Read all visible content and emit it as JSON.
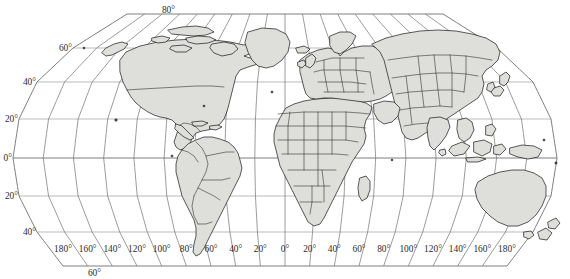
{
  "map": {
    "title": "World map (Robinson-style projection)",
    "projection": "robinson",
    "land_fill_color": "#dededb",
    "coast_stroke_color": "#1a1a1a",
    "graticule_color": "#8d8d8d",
    "background_color": "#ffffff",
    "degree_symbol": "°",
    "partial_top_text": "",
    "latitude_labels": [
      {
        "text": "80°",
        "value": 80,
        "hemisphere": "N"
      },
      {
        "text": "60°",
        "value": 60,
        "hemisphere": "N"
      },
      {
        "text": "40°",
        "value": 40,
        "hemisphere": "N"
      },
      {
        "text": "20°",
        "value": 20,
        "hemisphere": "N"
      },
      {
        "text": "0°",
        "value": 0,
        "hemisphere": ""
      },
      {
        "text": "20°",
        "value": -20,
        "hemisphere": "S"
      },
      {
        "text": "40°",
        "value": -40,
        "hemisphere": "S"
      },
      {
        "text": "60°",
        "value": -60,
        "hemisphere": "S"
      }
    ],
    "longitude_labels": [
      {
        "text": "180°",
        "value": -180
      },
      {
        "text": "160°",
        "value": -160
      },
      {
        "text": "140°",
        "value": -140
      },
      {
        "text": "120°",
        "value": -120
      },
      {
        "text": "100°",
        "value": -100
      },
      {
        "text": "80°",
        "value": -80
      },
      {
        "text": "60°",
        "value": -60
      },
      {
        "text": "40°",
        "value": -40
      },
      {
        "text": "20°",
        "value": -20
      },
      {
        "text": "0°",
        "value": 0
      },
      {
        "text": "20°",
        "value": 20
      },
      {
        "text": "40°",
        "value": 40
      },
      {
        "text": "60°",
        "value": 60
      },
      {
        "text": "80°",
        "value": 80
      },
      {
        "text": "100°",
        "value": 100
      },
      {
        "text": "120°",
        "value": 120
      },
      {
        "text": "140°",
        "value": 140
      },
      {
        "text": "160°",
        "value": 160
      },
      {
        "text": "180°",
        "value": 180
      }
    ],
    "graticule_spacing_degrees": 20,
    "latitude_range": [
      -60,
      80
    ],
    "longitude_range": [
      -180,
      180
    ],
    "continents_shown": [
      "North America",
      "South America",
      "Europe",
      "Africa",
      "Asia",
      "Australia"
    ],
    "features_shown": [
      "country borders",
      "Greenland",
      "Madagascar",
      "Japan",
      "New Zealand",
      "Indonesian archipelago",
      "British Isles",
      "Iceland"
    ]
  }
}
